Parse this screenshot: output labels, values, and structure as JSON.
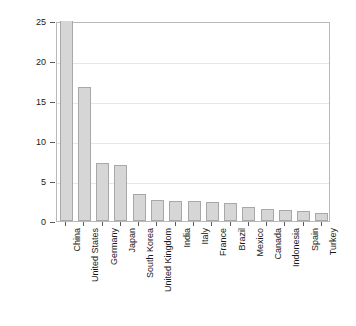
{
  "chart_data": {
    "type": "bar",
    "title": "",
    "subtitle": "",
    "xlabel": "",
    "ylabel": "Percentage of world total",
    "ylim": [
      0,
      25
    ],
    "yticks": [
      0,
      5,
      10,
      15,
      20,
      25
    ],
    "ytick_labels": [
      "0",
      "5",
      "10",
      "15",
      "20",
      "25"
    ],
    "grid": true,
    "grid_axis": "y",
    "legend": "none",
    "bar_fill_color": "#d6d6d6",
    "bar_edge_color": "#a8a8a8",
    "axis_color": "#b9b9b9",
    "gridline_color": "#e6e6e6",
    "note": "China bar is clipped at the top of the axis (value exceeds 25)",
    "categories": [
      "China",
      "United States",
      "Germany",
      "Japan",
      "South Korea",
      "United Kingdom",
      "India",
      "Italy",
      "France",
      "Brazil",
      "Mexico",
      "Canada",
      "Indonesia",
      "Spain",
      "Turkey"
    ],
    "values": [
      25,
      16.7,
      7.2,
      7.0,
      3.4,
      2.6,
      2.55,
      2.5,
      2.4,
      2.2,
      1.75,
      1.45,
      1.4,
      1.25,
      1.0
    ]
  }
}
